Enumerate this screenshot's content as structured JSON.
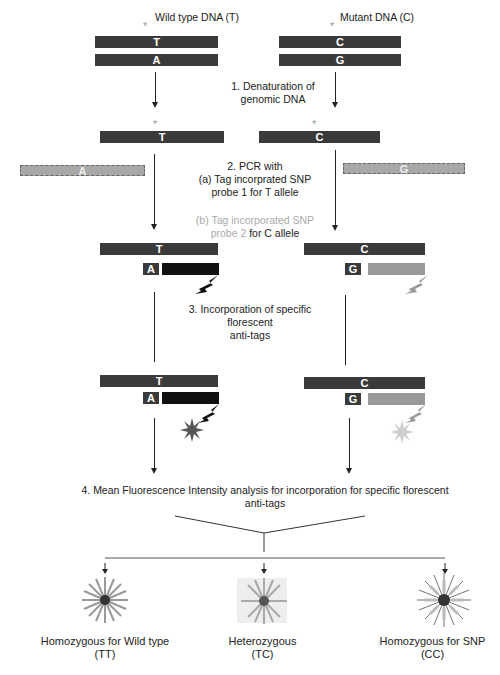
{
  "headers": {
    "wild_type": "Wild type DNA (T)",
    "mutant": "Mutant DNA (C)"
  },
  "bases": {
    "T": "T",
    "A": "A",
    "C": "C",
    "G": "G",
    "star": "*"
  },
  "steps": {
    "step1": [
      "1. Denaturation of",
      "genomic DNA"
    ],
    "step2": [
      "2. PCR with",
      "(a) Tag incorprated SNP",
      "probe 1 for T allele"
    ],
    "step2b": {
      "line1": "(b) Tag incorporated SNP",
      "line2_gray": "probe 2",
      "line2_dark": " for C allele"
    },
    "step3": [
      "3. Incorporation of specific",
      "florescent",
      "anti-tags"
    ],
    "step4": [
      "4. Mean Fluorescence Intensity analysis for incorporation for specific florescent",
      "anti-tags"
    ]
  },
  "results": [
    {
      "label": "Homozygous for Wild type",
      "code": "(TT)"
    },
    {
      "label": "Heterozygous",
      "code": "(TC)"
    },
    {
      "label": "Homozygous for SNP",
      "code": "(CC)"
    }
  ],
  "colors": {
    "strand": "#3a3a3a",
    "probe": "#a8a8a8",
    "tag_dark": "#111111",
    "tag_light": "#999999",
    "star_dark": "#555555",
    "star_light": "#cfcfcf"
  }
}
